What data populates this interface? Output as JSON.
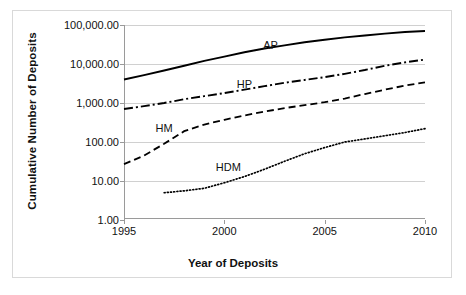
{
  "chart_data": {
    "type": "line",
    "title": "",
    "xlabel": "Year of Deposits",
    "ylabel": "Cumulative Number of Deposits",
    "xlim": [
      1995,
      2010
    ],
    "ylim": [
      1,
      100000
    ],
    "yscale": "log",
    "grid": true,
    "legend_position": "inline-labels",
    "xticks": [
      1995,
      2000,
      2005,
      2010
    ],
    "xtick_labels": [
      "1995",
      "2000",
      "2005",
      "2010"
    ],
    "yticks": [
      1,
      10,
      100,
      1000,
      10000,
      100000
    ],
    "ytick_labels": [
      "1.00",
      "10.00",
      "100.00",
      "1,000.00",
      "10,000.00",
      "100,000.00"
    ],
    "series": [
      {
        "name": "AP",
        "style": "solid",
        "label": "AP",
        "label_x": 2002.3,
        "label_y": 30000,
        "x": [
          1995,
          1996,
          1997,
          1998,
          1999,
          2000,
          2001,
          2002,
          2003,
          2004,
          2005,
          2006,
          2007,
          2008,
          2009,
          2010
        ],
        "values": [
          4000,
          5200,
          6800,
          9000,
          12000,
          15500,
          20000,
          25000,
          30000,
          36000,
          42000,
          48000,
          54000,
          60000,
          66000,
          70000
        ]
      },
      {
        "name": "HP",
        "style": "dash-dot",
        "label": "HP",
        "label_x": 2001.0,
        "label_y": 3000,
        "x": [
          1995,
          1996,
          1997,
          1998,
          1999,
          2000,
          2001,
          2002,
          2003,
          2004,
          2005,
          2006,
          2007,
          2008,
          2009,
          2010
        ],
        "values": [
          700,
          830,
          1000,
          1250,
          1500,
          1800,
          2200,
          2700,
          3300,
          3900,
          4600,
          5600,
          7000,
          9000,
          11000,
          13000
        ]
      },
      {
        "name": "HM",
        "style": "dashed",
        "label": "HM",
        "label_x": 1997.0,
        "label_y": 230,
        "x": [
          1995,
          1996,
          1997,
          1998,
          1999,
          2000,
          2001,
          2002,
          2003,
          2004,
          2005,
          2006,
          2007,
          2008,
          2009,
          2010
        ],
        "values": [
          27,
          45,
          90,
          190,
          280,
          370,
          480,
          600,
          740,
          880,
          1050,
          1300,
          1700,
          2200,
          2800,
          3400
        ]
      },
      {
        "name": "HDM",
        "style": "dotted",
        "label": "HDM",
        "label_x": 2000.2,
        "label_y": 23,
        "x": [
          1997,
          1998,
          1999,
          2000,
          2001,
          2002,
          2003,
          2004,
          2005,
          2006,
          2007,
          2008,
          2009,
          2010
        ],
        "values": [
          5,
          5.6,
          6.5,
          9,
          13,
          20,
          32,
          50,
          72,
          100,
          120,
          145,
          175,
          220
        ]
      }
    ]
  }
}
